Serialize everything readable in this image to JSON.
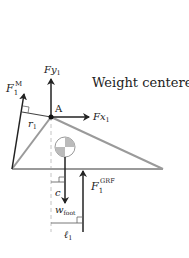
{
  "title": "Weight centered",
  "labels": {
    "muscle_force": "F",
    "muscle_force_sub": "1",
    "muscle_force_sup": "M",
    "moment_arm": "r",
    "moment_arm_sub": "1",
    "joint": "A",
    "fy": "Fy",
    "fy_sub": "1",
    "fx": "Fx",
    "fx_sub": "1",
    "grf": "F",
    "grf_sub": "1",
    "grf_sup": "GRF",
    "c": "c",
    "weight": "w",
    "weight_sub": "foot",
    "lever": "ℓ",
    "lever_sub": "1"
  },
  "colors": {
    "foot_outline": "#9a9a9a",
    "arrows": "#222222",
    "dashed": "#bbbbbb"
  }
}
